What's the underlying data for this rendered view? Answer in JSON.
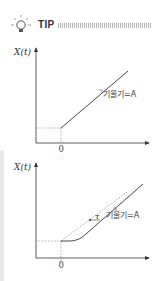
{
  "header": {
    "icon": "lightbulb-icon",
    "title": "TIP"
  },
  "graphs": [
    {
      "id": "top",
      "y_label": "X(t)",
      "origin_label": "0",
      "slope_label": "기울기=A"
    },
    {
      "id": "bottom",
      "y_label": "X(t)",
      "origin_label": "0",
      "slope_label": "기울기=A",
      "delay_label": "τ"
    }
  ],
  "colors": {
    "line": "#333333",
    "dashed": "#888888",
    "title_rule": "#bbbbbb"
  }
}
